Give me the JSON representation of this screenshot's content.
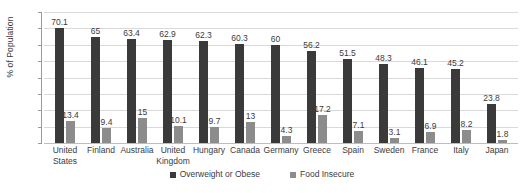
{
  "chart_data": {
    "type": "bar",
    "title": "",
    "xlabel": "",
    "ylabel": "% of Population",
    "ylim": [
      0,
      80
    ],
    "yticks": [
      0,
      10,
      20,
      30,
      40,
      50,
      60,
      70,
      80
    ],
    "grid": true,
    "legend_position": "bottom",
    "categories": [
      "United States",
      "Finland",
      "Australia",
      "United Kingdom",
      "Hungary",
      "Canada",
      "Germany",
      "Greece",
      "Spain",
      "Sweden",
      "France",
      "Italy",
      "Japan"
    ],
    "series": [
      {
        "name": "Overweight or Obese",
        "color": "#3a3a3a",
        "values": [
          70.1,
          65,
          63.4,
          62.9,
          62.3,
          60.3,
          60,
          56.2,
          51.5,
          48.3,
          46.1,
          45.2,
          23.8
        ]
      },
      {
        "name": "Food Insecure",
        "color": "#8c8c8c",
        "values": [
          13.4,
          9.4,
          15,
          10.1,
          9.7,
          13,
          4.3,
          17.2,
          7.1,
          3.1,
          6.9,
          8.2,
          1.8
        ]
      }
    ]
  }
}
